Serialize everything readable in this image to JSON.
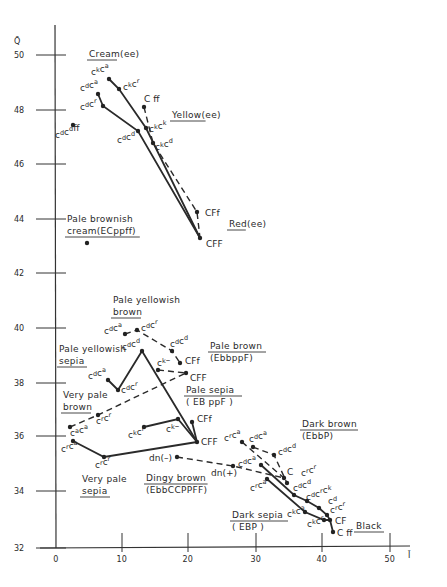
{
  "figure": {
    "axes": {
      "x_label": "Ī",
      "y_label": "Q̄",
      "x_ticks": [
        {
          "value": "0",
          "px": 56
        },
        {
          "value": "10",
          "px": 122
        },
        {
          "value": "20",
          "px": 188
        },
        {
          "value": "30",
          "px": 256
        },
        {
          "value": "40",
          "px": 322
        },
        {
          "value": "50",
          "px": 390
        }
      ],
      "y_ticks": [
        {
          "value": "50",
          "py": 55
        },
        {
          "value": "48",
          "py": 110
        },
        {
          "value": "46",
          "py": 164
        },
        {
          "value": "44",
          "py": 219
        },
        {
          "value": "42",
          "py": 273
        },
        {
          "value": "40",
          "py": 328
        },
        {
          "value": "38",
          "py": 383
        },
        {
          "value": "36",
          "py": 436
        },
        {
          "value": "34",
          "py": 491
        },
        {
          "value": "32",
          "py": 548
        }
      ]
    },
    "groups": [
      {
        "id": "cream",
        "lines": [
          "Cream(ee)"
        ],
        "underline": "Cream",
        "x": 89,
        "y": 57
      },
      {
        "id": "yellow",
        "lines": [
          "Yellow(ee)"
        ],
        "underline": "Yellow",
        "x": 172,
        "y": 118
      },
      {
        "id": "red",
        "lines": [
          "Red(ee)"
        ],
        "underline": "Red",
        "x": 229,
        "y": 227
      },
      {
        "id": "pale-brownish-cream",
        "lines": [
          "Pale brownish",
          "cream(ECppff)"
        ],
        "underline": "cream(ECppff)",
        "x": 67,
        "y": 222
      },
      {
        "id": "pale-yellowish-brown",
        "lines": [
          "Pale yellowish",
          "brown"
        ],
        "underline": "brown",
        "x": 113,
        "y": 303
      },
      {
        "id": "pale-yellowish-sepia",
        "lines": [
          "Pale yellowish",
          "sepia"
        ],
        "underline": "sepia",
        "x": 59,
        "y": 352
      },
      {
        "id": "pale-brown",
        "lines": [
          "Pale brown",
          "(EbbppF)"
        ],
        "underline": "Pale brown",
        "x": 210,
        "y": 349
      },
      {
        "id": "pale-sepia",
        "lines": [
          "Pale sepia",
          "( EB ppF )"
        ],
        "underline": "Pale sepia",
        "x": 186,
        "y": 393
      },
      {
        "id": "very-pale-brown",
        "lines": [
          "Very pale",
          "brown"
        ],
        "underline": "brown",
        "x": 63,
        "y": 398
      },
      {
        "id": "very-pale-sepia",
        "lines": [
          "Very pale",
          "sepia"
        ],
        "underline": "sepia",
        "x": 82,
        "y": 482
      },
      {
        "id": "dingy-brown",
        "lines": [
          "Dingy brown",
          "(EbbCCPPFF)"
        ],
        "underline": "Dingy brown",
        "x": 146,
        "y": 481
      },
      {
        "id": "dark-brown",
        "lines": [
          "Dark brown",
          "(EbbP)"
        ],
        "underline": "Dark brown",
        "x": 302,
        "y": 427
      },
      {
        "id": "dark-sepia",
        "lines": [
          "Dark sepia",
          "( EBP )"
        ],
        "underline": "Dark sepia",
        "x": 232,
        "y": 518
      },
      {
        "id": "black",
        "lines": [
          "Black"
        ],
        "underline": "Black",
        "x": 356,
        "y": 529
      }
    ],
    "points": [
      {
        "id": "p1",
        "base": [
          "c",
          "c"
        ],
        "sup": [
          "k",
          "a"
        ],
        "suffix": "",
        "x": 109,
        "y": 79,
        "lx": 91,
        "ly": 75
      },
      {
        "id": "p2",
        "base": [
          "c",
          "c"
        ],
        "sup": [
          "k",
          "r"
        ],
        "suffix": "",
        "x": 119,
        "y": 89,
        "lx": 123,
        "ly": 90
      },
      {
        "id": "p3",
        "base": [
          "c",
          "c"
        ],
        "sup": [
          "d",
          "a"
        ],
        "suffix": "",
        "x": 98,
        "y": 94,
        "lx": 80,
        "ly": 91
      },
      {
        "id": "p4",
        "base": [
          "c",
          "c"
        ],
        "sup": [
          "d",
          "r"
        ],
        "suffix": "",
        "x": 103,
        "y": 106,
        "lx": 80,
        "ly": 110
      },
      {
        "id": "p5",
        "base": [
          "C"
        ],
        "sup": [
          ""
        ],
        "suffix": " ff",
        "x": 144,
        "y": 107,
        "lx": 144,
        "ly": 102
      },
      {
        "id": "p6",
        "base": [
          "c",
          "c"
        ],
        "sup": [
          "d",
          "d"
        ],
        "suffix": "ff",
        "x": 73,
        "y": 125,
        "lx": 55,
        "ly": 138
      },
      {
        "id": "p7",
        "base": [
          "c",
          "c"
        ],
        "sup": [
          "k",
          "k"
        ],
        "suffix": "",
        "x": 146,
        "y": 128,
        "lx": 149,
        "ly": 132
      },
      {
        "id": "p8",
        "base": [
          "c",
          "c"
        ],
        "sup": [
          "d",
          "d"
        ],
        "suffix": "",
        "x": 138,
        "y": 131,
        "lx": 117,
        "ly": 143
      },
      {
        "id": "p9",
        "base": [
          "c",
          "c"
        ],
        "sup": [
          "k",
          "d"
        ],
        "suffix": "",
        "x": 153,
        "y": 143,
        "lx": 155,
        "ly": 150
      },
      {
        "id": "p10",
        "base": [
          "CFf"
        ],
        "sup": [
          ""
        ],
        "suffix": "",
        "x": 197,
        "y": 212,
        "lx": 205,
        "ly": 216
      },
      {
        "id": "p11",
        "base": [
          "CFF"
        ],
        "sup": [
          ""
        ],
        "suffix": "",
        "x": 200,
        "y": 238,
        "lx": 206,
        "ly": 247
      },
      {
        "id": "p12",
        "base": [
          ""
        ],
        "sup": [
          ""
        ],
        "suffix": "",
        "x": 87,
        "y": 243,
        "lx": 0,
        "ly": 0
      },
      {
        "id": "p13",
        "base": [
          "c",
          "c"
        ],
        "sup": [
          "d",
          "a"
        ],
        "suffix": "",
        "x": 125,
        "y": 334,
        "lx": 104,
        "ly": 334
      },
      {
        "id": "p14",
        "base": [
          "c",
          "c"
        ],
        "sup": [
          "d",
          "r"
        ],
        "suffix": "",
        "x": 137,
        "y": 330,
        "lx": 141,
        "ly": 331
      },
      {
        "id": "p15",
        "base": [
          "c",
          "c"
        ],
        "sup": [
          "d",
          "d"
        ],
        "suffix": "",
        "x": 142,
        "y": 351,
        "lx": 122,
        "ly": 350
      },
      {
        "id": "p16",
        "base": [
          "c",
          "c"
        ],
        "sup": [
          "d",
          "d"
        ],
        "suffix": "",
        "x": 172,
        "y": 351,
        "lx": 170,
        "ly": 347
      },
      {
        "id": "p17",
        "base": [
          "CFf"
        ],
        "sup": [
          ""
        ],
        "suffix": "",
        "x": 180,
        "y": 363,
        "lx": 185,
        "ly": 364
      },
      {
        "id": "p18",
        "base": [
          "c"
        ],
        "sup": [
          "k"
        ],
        "suffix": "–",
        "x": 158,
        "y": 370,
        "lx": 157,
        "ly": 366
      },
      {
        "id": "p19",
        "base": [
          "CFF"
        ],
        "sup": [
          ""
        ],
        "suffix": "",
        "x": 186,
        "y": 373,
        "lx": 190,
        "ly": 381
      },
      {
        "id": "p20",
        "base": [
          "c",
          "c"
        ],
        "sup": [
          "d",
          "a"
        ],
        "suffix": "",
        "x": 108,
        "y": 380,
        "lx": 88,
        "ly": 379
      },
      {
        "id": "p21",
        "base": [
          "c",
          "c"
        ],
        "sup": [
          "d",
          "r"
        ],
        "suffix": "",
        "x": 118,
        "y": 390,
        "lx": 121,
        "ly": 393
      },
      {
        "id": "p22",
        "base": [
          "c",
          "c"
        ],
        "sup": [
          "r",
          "r"
        ],
        "suffix": "",
        "x": 98,
        "y": 415,
        "lx": 96,
        "ly": 424
      },
      {
        "id": "p23",
        "base": [
          "c",
          "c"
        ],
        "sup": [
          "a",
          "a"
        ],
        "suffix": "",
        "x": 70,
        "y": 427,
        "lx": 70,
        "ly": 436
      },
      {
        "id": "p24",
        "base": [
          "c"
        ],
        "sup": [
          "k"
        ],
        "suffix": "–",
        "x": 178,
        "y": 419,
        "lx": 166,
        "ly": 432
      },
      {
        "id": "p25",
        "base": [
          "CFf"
        ],
        "sup": [
          ""
        ],
        "suffix": "",
        "x": 192,
        "y": 422,
        "lx": 197,
        "ly": 422
      },
      {
        "id": "p26",
        "base": [
          "c",
          "c"
        ],
        "sup": [
          "k",
          "r"
        ],
        "suffix": "",
        "x": 144,
        "y": 427,
        "lx": 128,
        "ly": 438
      },
      {
        "id": "p27",
        "base": [
          "CFF"
        ],
        "sup": [
          ""
        ],
        "suffix": "",
        "x": 197,
        "y": 442,
        "lx": 201,
        "ly": 445
      },
      {
        "id": "p28",
        "base": [
          "c",
          "c"
        ],
        "sup": [
          "r",
          "a"
        ],
        "suffix": "",
        "x": 73,
        "y": 441,
        "lx": 61,
        "ly": 452
      },
      {
        "id": "p29",
        "base": [
          "c",
          "c"
        ],
        "sup": [
          "r",
          "r"
        ],
        "suffix": "",
        "x": 104,
        "y": 457,
        "lx": 95,
        "ly": 468
      },
      {
        "id": "p30",
        "base": [
          "dn(–)"
        ],
        "sup": [
          ""
        ],
        "suffix": "",
        "x": 177,
        "y": 457,
        "lx": 149,
        "ly": 461
      },
      {
        "id": "p31",
        "base": [
          "dn(+)"
        ],
        "sup": [
          ""
        ],
        "suffix": "",
        "x": 233,
        "y": 466,
        "lx": 211,
        "ly": 476
      },
      {
        "id": "p32",
        "base": [
          "c",
          "c"
        ],
        "sup": [
          "r",
          "a"
        ],
        "suffix": "",
        "x": 242,
        "y": 442,
        "lx": 224,
        "ly": 441
      },
      {
        "id": "p33",
        "base": [
          "c",
          "c"
        ],
        "sup": [
          "d",
          "a"
        ],
        "suffix": "",
        "x": 253,
        "y": 447,
        "lx": 249,
        "ly": 442
      },
      {
        "id": "p34",
        "base": [
          "c",
          "c"
        ],
        "sup": [
          "d",
          "d"
        ],
        "suffix": "",
        "x": 274,
        "y": 455,
        "lx": 278,
        "ly": 455
      },
      {
        "id": "p35",
        "base": [
          "c",
          "c"
        ],
        "sup": [
          "d",
          "a"
        ],
        "suffix": "",
        "x": 261,
        "y": 465,
        "lx": 238,
        "ly": 467
      },
      {
        "id": "p36",
        "base": [
          "C"
        ],
        "sup": [
          ""
        ],
        "suffix": "",
        "x": 284,
        "y": 478,
        "lx": 287,
        "ly": 475
      },
      {
        "id": "p37",
        "base": [
          "c",
          "c"
        ],
        "sup": [
          "r",
          "r"
        ],
        "suffix": "",
        "x": 287,
        "y": 483,
        "lx": 301,
        "ly": 476
      },
      {
        "id": "p38",
        "base": [
          "c",
          "c"
        ],
        "sup": [
          "r",
          "a"
        ],
        "suffix": "",
        "x": 267,
        "y": 479,
        "lx": 250,
        "ly": 491
      },
      {
        "id": "p39",
        "base": [
          "c",
          "c"
        ],
        "sup": [
          "d",
          "d"
        ],
        "suffix": "",
        "x": 294,
        "y": 495,
        "lx": 293,
        "ly": 491
      },
      {
        "id": "p40",
        "base": [
          "c",
          "c",
          "c"
        ],
        "sup": [
          "d",
          "r",
          "k"
        ],
        "suffix": "",
        "x": 307,
        "y": 501,
        "lx": 306,
        "ly": 500
      },
      {
        "id": "p41",
        "base": [
          "c"
        ],
        "sup": [
          "d"
        ],
        "suffix": "",
        "x": 319,
        "y": 508,
        "lx": 328,
        "ly": 504
      },
      {
        "id": "p42",
        "base": [
          "c",
          "c"
        ],
        "sup": [
          "r",
          "r"
        ],
        "suffix": "",
        "x": 327,
        "y": 515,
        "lx": 330,
        "ly": 513
      },
      {
        "id": "p43",
        "base": [
          "c",
          "c"
        ],
        "sup": [
          "k",
          "a"
        ],
        "suffix": "",
        "x": 305,
        "y": 512,
        "lx": 287,
        "ly": 517
      },
      {
        "id": "p44",
        "base": [
          "c",
          "c"
        ],
        "sup": [
          "k",
          "r"
        ],
        "suffix": "",
        "x": 324,
        "y": 520,
        "lx": 307,
        "ly": 527
      },
      {
        "id": "p45",
        "base": [
          "CF"
        ],
        "sup": [
          ""
        ],
        "suffix": "",
        "x": 330,
        "y": 520,
        "lx": 335,
        "ly": 524
      },
      {
        "id": "p46",
        "base": [
          "C ff"
        ],
        "sup": [
          ""
        ],
        "suffix": "",
        "x": 333,
        "y": 532,
        "lx": 337,
        "ly": 536
      }
    ],
    "solid_paths": [
      "109,79 119,89 146,128 200,238",
      "98,94 103,106 138,131 200,238",
      "108,380 118,390 142,351 197,442",
      "144,427 178,419 197,442",
      "192,422 197,442",
      "73,441 104,457 197,442",
      "261,465 294,495 307,501 319,508 327,515 330,520",
      "267,479 305,512 324,520 330,520",
      "330,520 333,532"
    ],
    "dashed_paths": [
      "144,107 153,143 197,212 200,238",
      "125,334 137,330 172,351 180,363",
      "158,370 186,373",
      "70,427 98,415 186,373",
      "177,457 233,466 284,478",
      "242,442 284,478",
      "253,447 274,455 287,483"
    ]
  }
}
